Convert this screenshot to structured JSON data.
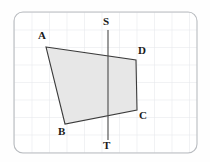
{
  "figure": {
    "name": "quadrilateral-with-vertical-line-on-grid",
    "canvas": {
      "width": 210,
      "height": 162
    },
    "background_color": "#fefefe",
    "frame": {
      "name": "rounded-grid-panel",
      "x": 14,
      "y": 12,
      "width": 183,
      "height": 141,
      "corner_radius": 9,
      "stroke_color": "#b9bcc0",
      "stroke_width": 1.1,
      "fill_color": "#ffffff"
    },
    "grid": {
      "visible": true,
      "spacing": 17.5,
      "origin_x": 14,
      "origin_y": 12,
      "line_color": "#e3e6ea",
      "line_width": 1
    },
    "shape": {
      "name": "quadrilateral-ABCD",
      "type": "polygon",
      "fill_color": "#e7e7e7",
      "stroke_color": "#3c3c3c",
      "stroke_width": 1.1,
      "vertices": [
        {
          "id": "A",
          "x": 46,
          "y": 47
        },
        {
          "id": "D",
          "x": 136,
          "y": 60
        },
        {
          "id": "C",
          "x": 137,
          "y": 110
        },
        {
          "id": "B",
          "x": 65,
          "y": 124
        }
      ]
    },
    "axis_line": {
      "name": "vertical-line-ST",
      "type": "line",
      "x": 108,
      "y1": 30,
      "y2": 140,
      "stroke_color": "#4a4a4a",
      "stroke_width": 1.1,
      "endpoints": [
        {
          "id": "S",
          "x": 108,
          "y": 30
        },
        {
          "id": "T",
          "x": 108,
          "y": 140
        }
      ]
    },
    "labels": [
      {
        "id": "A",
        "text": "A",
        "x": 38,
        "y": 30
      },
      {
        "id": "S",
        "text": "S",
        "x": 103,
        "y": 16
      },
      {
        "id": "D",
        "text": "D",
        "x": 138,
        "y": 45
      },
      {
        "id": "C",
        "text": "C",
        "x": 139,
        "y": 110
      },
      {
        "id": "B",
        "text": "B",
        "x": 58,
        "y": 126
      },
      {
        "id": "T",
        "text": "T",
        "x": 103,
        "y": 140
      }
    ]
  }
}
